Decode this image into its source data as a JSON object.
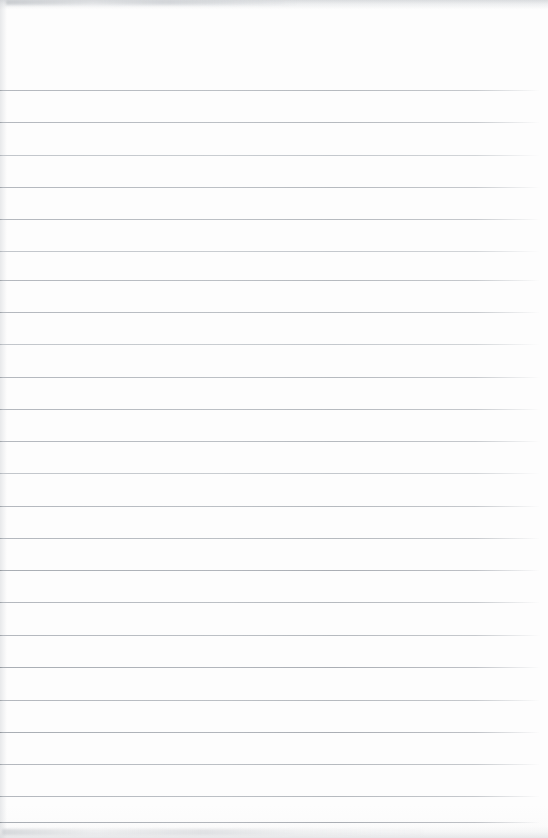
{
  "document": {
    "type": "lined-paper",
    "title": "",
    "body_text": "",
    "page_width": 548,
    "page_height": 838,
    "background_color": "#fdfdfd",
    "rule_color": "#b8bcc2",
    "top_margin": 90,
    "line_spacing": 32.3,
    "line_start_x": 0,
    "line_end_x": 540,
    "line_count": 24,
    "lines": [
      {
        "index": 1,
        "y": 90,
        "weight": "normal",
        "text": ""
      },
      {
        "index": 2,
        "y": 122,
        "weight": "normal",
        "text": ""
      },
      {
        "index": 3,
        "y": 155,
        "weight": "light",
        "text": ""
      },
      {
        "index": 4,
        "y": 187,
        "weight": "normal",
        "text": ""
      },
      {
        "index": 5,
        "y": 219,
        "weight": "normal",
        "text": ""
      },
      {
        "index": 6,
        "y": 251,
        "weight": "light",
        "text": ""
      },
      {
        "index": 7,
        "y": 280,
        "weight": "normal",
        "text": ""
      },
      {
        "index": 8,
        "y": 312,
        "weight": "normal",
        "text": ""
      },
      {
        "index": 9,
        "y": 344,
        "weight": "light",
        "text": ""
      },
      {
        "index": 10,
        "y": 377,
        "weight": "normal",
        "text": ""
      },
      {
        "index": 11,
        "y": 409,
        "weight": "normal",
        "text": ""
      },
      {
        "index": 12,
        "y": 441,
        "weight": "normal",
        "text": ""
      },
      {
        "index": 13,
        "y": 473,
        "weight": "light",
        "text": ""
      },
      {
        "index": 14,
        "y": 506,
        "weight": "normal",
        "text": ""
      },
      {
        "index": 15,
        "y": 538,
        "weight": "normal",
        "text": ""
      },
      {
        "index": 16,
        "y": 570,
        "weight": "dark",
        "text": ""
      },
      {
        "index": 17,
        "y": 602,
        "weight": "normal",
        "text": ""
      },
      {
        "index": 18,
        "y": 635,
        "weight": "normal",
        "text": ""
      },
      {
        "index": 19,
        "y": 667,
        "weight": "dark",
        "text": ""
      },
      {
        "index": 20,
        "y": 700,
        "weight": "normal",
        "text": ""
      },
      {
        "index": 21,
        "y": 732,
        "weight": "dark",
        "text": ""
      },
      {
        "index": 22,
        "y": 764,
        "weight": "normal",
        "text": ""
      },
      {
        "index": 23,
        "y": 796,
        "weight": "normal",
        "text": ""
      },
      {
        "index": 24,
        "y": 822,
        "weight": "dark",
        "text": ""
      }
    ]
  }
}
